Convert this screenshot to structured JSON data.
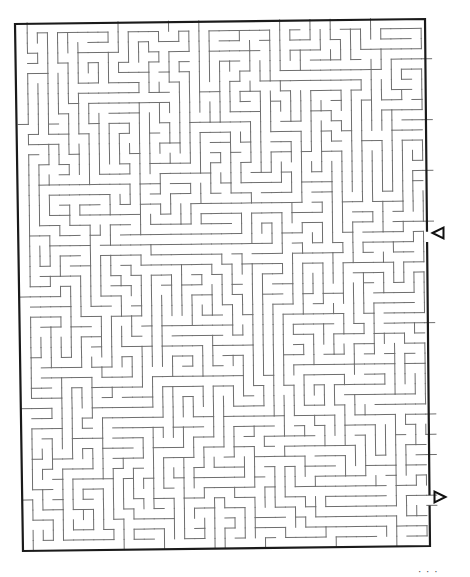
{
  "puzzle": {
    "type": "maze",
    "grid": {
      "cols": 41,
      "rows": 52,
      "origin_x": 17,
      "origin_y": 23,
      "cell_w": 10.1,
      "cell_h": 10.15,
      "skew_x_per_row": 0.12,
      "skew_y_per_col": -0.12,
      "seed": 20231
    },
    "colors": {
      "wall": "#6e6e6e",
      "border": "#1a1a1a",
      "arrow": "#111111",
      "background": "#ffffff"
    },
    "border": {
      "top_left": [
        15,
        24
      ],
      "top_right": [
        425,
        19
      ],
      "bottom_right": [
        430,
        546
      ],
      "bottom_left": [
        23,
        551
      ],
      "stroke_width": 2.2
    },
    "entrance": {
      "side": "right",
      "row": 21,
      "arrow_direction": "left",
      "arrow_x": 438,
      "arrow_y": 233
    },
    "exit": {
      "side": "right",
      "row": 47,
      "arrow_direction": "right",
      "arrow_x": 440,
      "arrow_y": 497
    },
    "page_number": "· · ·"
  }
}
